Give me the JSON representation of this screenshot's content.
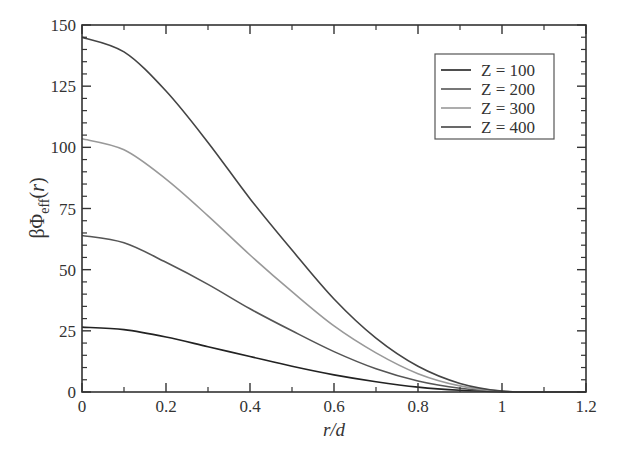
{
  "chart_data": {
    "type": "line",
    "title": "",
    "xlabel": "r/d",
    "ylabel": "βΦ_eff(r)",
    "xlim": [
      0,
      1.2
    ],
    "ylim": [
      0,
      150
    ],
    "xticks": [
      "0",
      "0.2",
      "0.4",
      "0.6",
      "0.8",
      "1",
      "1.2"
    ],
    "yticks": [
      "0",
      "25",
      "50",
      "75",
      "100",
      "125",
      "150"
    ],
    "grid": false,
    "legend_position": "upper right",
    "x": [
      0,
      0.1,
      0.2,
      0.3,
      0.4,
      0.5,
      0.6,
      0.7,
      0.8,
      0.9,
      1.0,
      1.1,
      1.2
    ],
    "series": [
      {
        "name": "Z = 100",
        "color": "#222222",
        "values": [
          26.5,
          25.5,
          22.5,
          18.5,
          14.5,
          10.5,
          7.0,
          4.2,
          2.0,
          0.7,
          0.1,
          0,
          0
        ]
      },
      {
        "name": "Z = 200",
        "color": "#555555",
        "values": [
          64,
          61,
          53,
          44,
          34,
          25,
          16.5,
          9.5,
          4.5,
          1.5,
          0.2,
          0,
          0
        ]
      },
      {
        "name": "Z = 300",
        "color": "#999999",
        "values": [
          103.5,
          99,
          87,
          72,
          56,
          41,
          27,
          16,
          7.5,
          2.5,
          0.3,
          0,
          0
        ]
      },
      {
        "name": "Z = 400",
        "color": "#444444",
        "values": [
          145,
          139,
          123,
          102,
          79,
          58,
          38,
          22,
          10.5,
          3.5,
          0.4,
          0,
          0
        ]
      }
    ]
  }
}
